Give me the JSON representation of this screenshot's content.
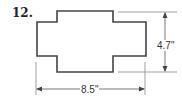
{
  "problem": {
    "number": "12."
  },
  "figure": {
    "shape": "cross-shaped polygon",
    "outline_color": "#444444",
    "dimensions": {
      "height_label": "4.7\"",
      "width_label": "8.5\""
    }
  }
}
